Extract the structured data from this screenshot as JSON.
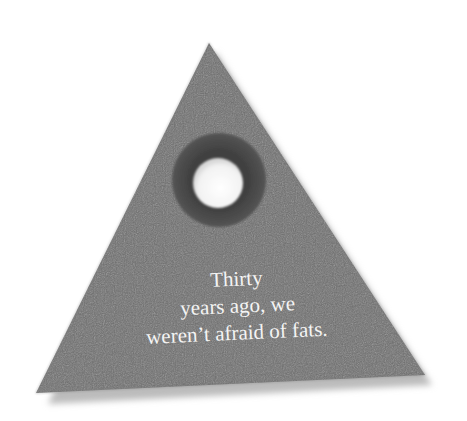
{
  "figure": {
    "shape": "triangle",
    "colors": {
      "background": "#ffffff",
      "triangle_fill": "#6e6e6e",
      "shadow": "#bdbdbd",
      "ring": "#4a4a4a",
      "hole": "#ffffff",
      "text": "#f4f4f4"
    },
    "caption_lines": [
      "Thirty",
      "years ago, we",
      "weren’t afraid of fats."
    ],
    "icon": "ring-hole-icon"
  }
}
